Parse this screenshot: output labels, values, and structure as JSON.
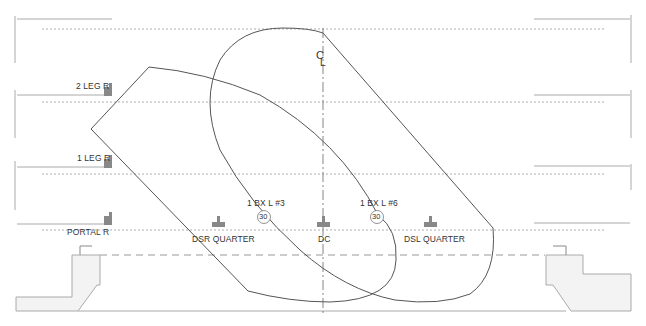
{
  "diagram": {
    "colors": {
      "outline": "#555555",
      "rule": "#aaaaaa",
      "dotted": "#999999",
      "fill": "#f3f3f3",
      "instrument": "#888888",
      "text": "#333333"
    },
    "centerline": {
      "label": "C",
      "sub": "L"
    },
    "positions": [
      {
        "id": "2-leg-r",
        "label": "2 LEG R"
      },
      {
        "id": "1-leg-r",
        "label": "1 LEG R"
      },
      {
        "id": "portal-r",
        "label": "PORTAL R"
      }
    ],
    "stage_areas": [
      {
        "id": "dsr-quarter",
        "label": "DSR QUARTER"
      },
      {
        "id": "dc",
        "label": "DC"
      },
      {
        "id": "dsl-quarter",
        "label": "DSL QUARTER"
      }
    ],
    "units": [
      {
        "id": "unit-3",
        "label": "1 BX L #3",
        "number": "30"
      },
      {
        "id": "unit-6",
        "label": "1 BX L #6",
        "number": "30"
      }
    ]
  }
}
